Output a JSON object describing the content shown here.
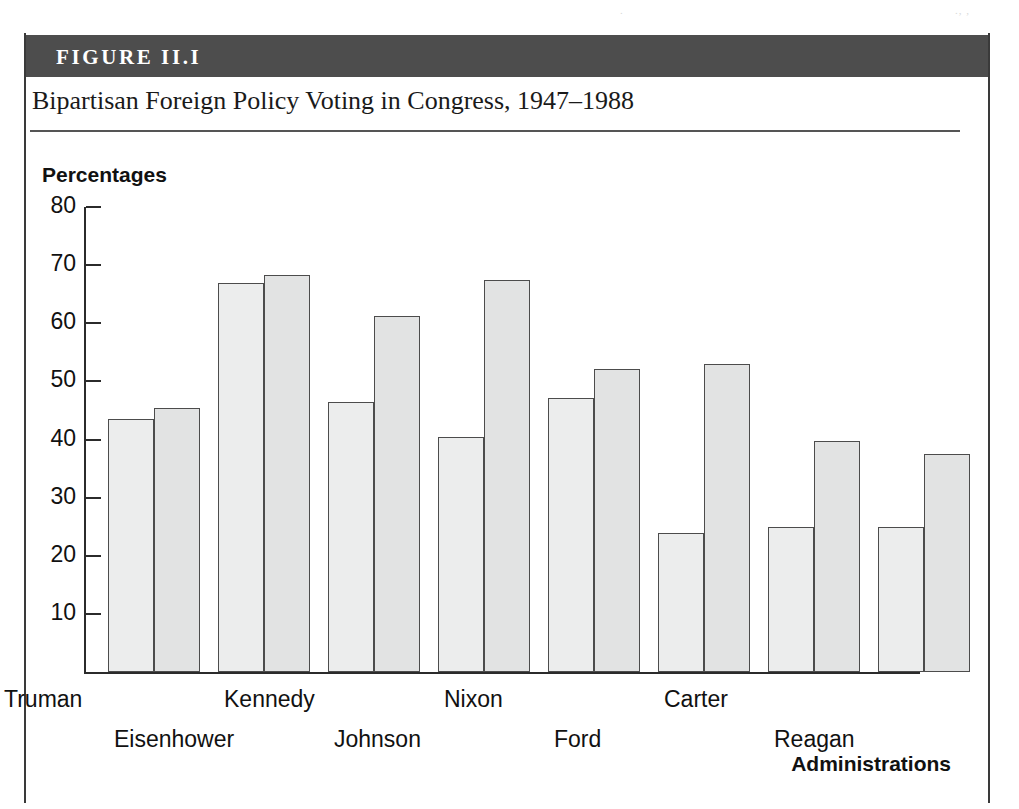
{
  "figure": {
    "banner_label": "FIGURE II.I",
    "title": "Bipartisan Foreign Policy Voting in Congress, 1947–1988",
    "artifact_left": ".",
    "artifact_right": "., ,"
  },
  "colors": {
    "banner_background": "#4d4d4d",
    "banner_text": "#ffffff",
    "bar_fill_first": "#eceded",
    "bar_fill_second": "#e2e3e3",
    "bar_stroke": "#4c4c4c",
    "axis": "#2b2b2b",
    "text": "#111111"
  },
  "chart_data": {
    "type": "bar",
    "title": "Bipartisan Foreign Policy Voting in Congress, 1947–1988",
    "xlabel": "Administrations",
    "ylabel": "Percentages",
    "ylim": [
      0,
      80
    ],
    "yticks": [
      10,
      20,
      30,
      40,
      50,
      60,
      70,
      80
    ],
    "ytick_labels": [
      "10",
      "20",
      "30",
      "40",
      "50",
      "60",
      "70",
      "80"
    ],
    "grid": false,
    "legend": null,
    "categories": [
      "Truman",
      "Eisenhower",
      "Kennedy",
      "Johnson",
      "Nixon",
      "Ford",
      "Carter",
      "Reagan"
    ],
    "series": [
      {
        "name": "First bar",
        "values": [
          43.5,
          67.0,
          46.5,
          40.5,
          47.2,
          24.0,
          25.0,
          25.0
        ]
      },
      {
        "name": "Second bar",
        "values": [
          45.5,
          68.3,
          61.3,
          67.5,
          52.2,
          53.0,
          39.8,
          37.5
        ]
      }
    ]
  }
}
